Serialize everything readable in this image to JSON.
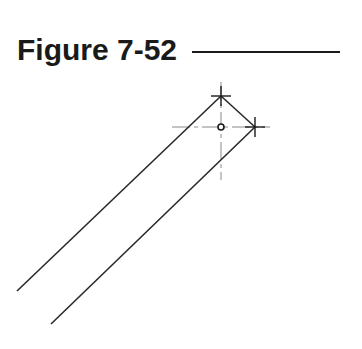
{
  "figure": {
    "title": "Figure 7-52"
  },
  "drawing": {
    "line_color": "#2a2a2a",
    "center_line_color": "#8a8a8a",
    "outline_segments": [
      {
        "name": "left-edge-line",
        "x1": 17,
        "y1": 291,
        "x2": 221,
        "y2": 96
      },
      {
        "name": "top-edge-line",
        "x1": 221,
        "y1": 96,
        "x2": 255,
        "y2": 127
      },
      {
        "name": "right-edge-line",
        "x1": 255,
        "y1": 127,
        "x2": 51,
        "y2": 324
      }
    ],
    "snap_markers": [
      {
        "name": "top-vertex-marker",
        "x": 221,
        "y": 96
      },
      {
        "name": "right-vertex-marker",
        "x": 255,
        "y": 127
      }
    ],
    "center_point": {
      "x": 221,
      "y": 127,
      "r": 3
    },
    "center_lines": {
      "horizontal": {
        "x1": 172,
        "x2": 270,
        "y": 127
      },
      "vertical": {
        "x": 221,
        "y1": 82,
        "y2": 180
      }
    }
  }
}
